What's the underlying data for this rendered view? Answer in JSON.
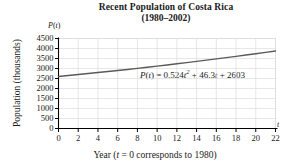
{
  "chart_data": {
    "type": "line",
    "title": "Recent Population of Costa Rica",
    "subtitle": "(1980–2002)",
    "xlabel": "Year (t = 0 corresponds to 1980)",
    "ylabel": "Population (thousands)",
    "x_axis_symbol": "t",
    "y_axis_symbol": "P(t)",
    "xlim": [
      0,
      22
    ],
    "ylim": [
      0,
      4500
    ],
    "xticks": [
      0,
      2,
      4,
      6,
      8,
      10,
      12,
      14,
      16,
      18,
      20,
      22
    ],
    "yticks": [
      0,
      500,
      1000,
      1500,
      2000,
      2500,
      3000,
      3500,
      4000,
      4500
    ],
    "xtick_labels": [
      "0",
      "2",
      "4",
      "6",
      "8",
      "10",
      "12",
      "14",
      "16",
      "18",
      "20",
      "22"
    ],
    "ytick_labels": [
      "0",
      "500",
      "1000",
      "1500",
      "2000",
      "2500",
      "3000",
      "3500",
      "4000",
      "4500"
    ],
    "grid": true,
    "legend": "none",
    "annotation": "P(t) = 0.524t² + 46.3t + 2603",
    "equation": {
      "lhs": "P(t)",
      "equals": "=",
      "a": 0.524,
      "b": 46.3,
      "c": 2603,
      "term_a": "0.524t",
      "exponent": "2",
      "term_b": "+ 46.3t",
      "term_c": "+ 2603"
    },
    "series": [
      {
        "name": "P(t) = 0.524t^2 + 46.3t + 2603",
        "color": "#5a5a5a",
        "x": [
          0,
          1,
          2,
          3,
          4,
          5,
          6,
          7,
          8,
          9,
          10,
          11,
          12,
          13,
          14,
          15,
          16,
          17,
          18,
          19,
          20,
          21,
          22
        ],
        "values": [
          2603,
          2649.8,
          2697.7,
          2746.6,
          2796.6,
          2847.7,
          2899.8,
          2952.9,
          3007.1,
          3062.4,
          3118.7,
          3176.1,
          3234.5,
          3294.0,
          3354.5,
          3416.1,
          3478.7,
          3542.4,
          3607.2,
          3673.0,
          3739.8,
          3807.7,
          3876.7
        ]
      }
    ]
  },
  "figure": {
    "background_color": "#ffffff",
    "axis_color": "#000000",
    "grid_color": "#dcdcdc",
    "curve_color": "#5a5a5a",
    "text_color": "#1a1a1a"
  }
}
